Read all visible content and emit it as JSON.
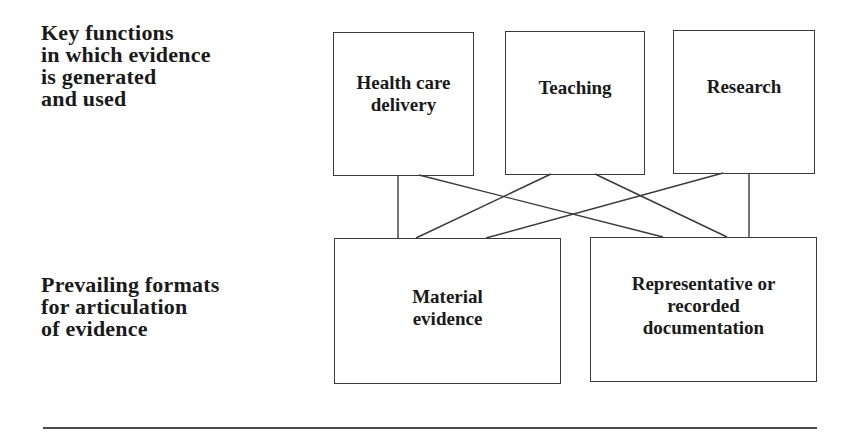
{
  "diagram": {
    "rows": {
      "top": {
        "label_lines": [
          "Key functions",
          "in which evidence",
          "is generated",
          "and used"
        ]
      },
      "bottom": {
        "label_lines": [
          "Prevailing formats",
          "for articulation",
          "of evidence"
        ]
      }
    },
    "nodes": {
      "health_care_delivery": {
        "lines": [
          "Health care",
          "delivery"
        ]
      },
      "teaching": {
        "lines": [
          "Teaching"
        ]
      },
      "research": {
        "lines": [
          "Research"
        ]
      },
      "material_evidence": {
        "lines": [
          "Material",
          "evidence"
        ]
      },
      "representative_documentation": {
        "lines": [
          "Representative or",
          "recorded",
          "documentation"
        ]
      }
    },
    "edges": [
      {
        "from": "health_care_delivery",
        "to": "material_evidence"
      },
      {
        "from": "health_care_delivery",
        "to": "representative_documentation"
      },
      {
        "from": "teaching",
        "to": "material_evidence"
      },
      {
        "from": "teaching",
        "to": "representative_documentation"
      },
      {
        "from": "research",
        "to": "material_evidence"
      },
      {
        "from": "research",
        "to": "representative_documentation"
      }
    ],
    "colors": {
      "line": "#3a3a3a",
      "text": "#1a1a1a",
      "background": "#ffffff"
    }
  }
}
